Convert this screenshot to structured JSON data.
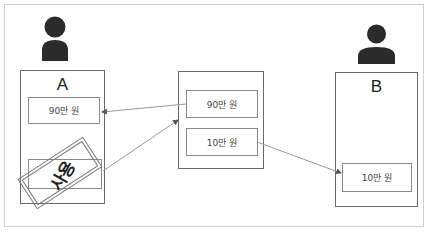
{
  "diagram": {
    "nodes": {
      "user_a": {
        "label": "A",
        "icon": "person-icon",
        "items": [
          {
            "text": "90만 원"
          },
          {
            "text": "",
            "stamp": "사용"
          }
        ]
      },
      "middle": {
        "label": "",
        "items": [
          {
            "text": "90만 원"
          },
          {
            "text": "10만 원"
          }
        ]
      },
      "user_b": {
        "label": "B",
        "icon": "person-icon",
        "items": [
          {
            "text": "10만 원"
          }
        ]
      }
    },
    "edges": [
      {
        "from": "middle.items.0",
        "to": "user_a.items.0"
      },
      {
        "from": "user_a.items.1",
        "to": "middle"
      },
      {
        "from": "middle.items.1",
        "to": "user_b.items.0"
      }
    ],
    "colors": {
      "frame": "#cfcfcf",
      "box_border": "#6a6a6a",
      "arrow": "#9a9a9a",
      "icon": "#2b2b2b"
    }
  }
}
